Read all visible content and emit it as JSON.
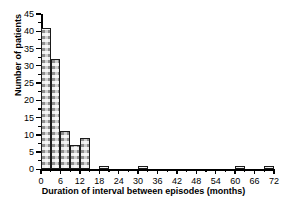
{
  "chart_data": {
    "type": "bar",
    "title": "",
    "xlabel": "Duration of interval between episodes (months)",
    "ylabel": "Number of patients",
    "xlim": [
      0,
      72
    ],
    "ylim": [
      0,
      45
    ],
    "grid": false,
    "legend": null,
    "bin_width": 3,
    "x_ticks": [
      0,
      6,
      12,
      18,
      24,
      30,
      36,
      42,
      48,
      54,
      60,
      66,
      72
    ],
    "x_tick_labels": [
      "0",
      "6",
      "12",
      "18",
      "24",
      "30",
      "36",
      "42",
      "48",
      "54",
      "60",
      "66",
      "72"
    ],
    "x_minor_ticks": [
      3,
      9,
      15,
      21,
      27,
      33,
      39,
      45,
      51,
      57,
      63,
      69
    ],
    "y_ticks": [
      0,
      5,
      10,
      15,
      20,
      25,
      30,
      35,
      40,
      45
    ],
    "y_tick_labels": [
      "0",
      "5",
      "10",
      "15",
      "20",
      "25",
      "30",
      "35",
      "40",
      "45"
    ],
    "y_minor_ticks": [
      2.5,
      7.5,
      12.5,
      17.5,
      22.5,
      27.5,
      32.5,
      37.5,
      42.5
    ],
    "bin_edges": [
      0,
      3,
      6,
      9,
      12,
      15,
      18,
      21,
      24,
      27,
      30,
      33,
      36,
      39,
      42,
      45,
      48,
      51,
      54,
      57,
      60,
      63,
      66,
      69,
      72
    ],
    "categories": [
      "0-3",
      "3-6",
      "6-9",
      "9-12",
      "12-15",
      "15-18",
      "18-21",
      "21-24",
      "24-27",
      "27-30",
      "30-33",
      "33-36",
      "36-39",
      "39-42",
      "42-45",
      "45-48",
      "48-51",
      "51-54",
      "54-57",
      "57-60",
      "60-63",
      "63-66",
      "66-69",
      "69-72"
    ],
    "values": [
      41,
      32,
      11,
      7,
      9,
      0,
      1,
      0,
      0,
      0,
      1,
      0,
      0,
      0,
      0,
      0,
      0,
      0,
      0,
      0,
      1,
      0,
      0,
      1
    ],
    "bar_facecolor": "#cfcfcf",
    "bar_edgecolor": "#1a1a1a",
    "bar_hatch": "dotted-checker"
  }
}
